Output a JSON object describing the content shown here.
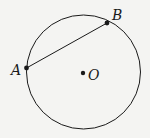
{
  "diagram": {
    "type": "geometry",
    "circle": {
      "center_label": "O",
      "cx": 83.5,
      "cy": 72,
      "r": 57
    },
    "points": [
      {
        "label": "A",
        "x": 26.5,
        "y": 68
      },
      {
        "label": "B",
        "x": 107,
        "y": 23
      },
      {
        "label": "O",
        "x": 83,
        "y": 73
      }
    ],
    "segments": [
      {
        "from": "A",
        "to": "B",
        "kind": "chord"
      }
    ],
    "colors": {
      "stroke": "#1a1a1a",
      "background": "#f4f4f2"
    }
  }
}
